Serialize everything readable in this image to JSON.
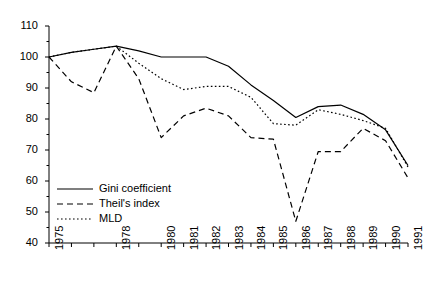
{
  "chart_data": {
    "type": "line",
    "title": "",
    "subtitle": "",
    "xlabel": "",
    "ylabel": "",
    "xlim": [
      1975,
      1991
    ],
    "ylim": [
      40,
      110
    ],
    "grid": false,
    "legend_position": "inside-bottom-left",
    "x": [
      1975,
      1976,
      1977,
      1978,
      1979,
      1980,
      1981,
      1982,
      1983,
      1984,
      1985,
      1986,
      1987,
      1988,
      1989,
      1990,
      1991
    ],
    "y_ticks": [
      40,
      50,
      60,
      70,
      80,
      90,
      100,
      110
    ],
    "y_minor_ticks": [
      45,
      55,
      65,
      75,
      85,
      95,
      105
    ],
    "x_tick_labels": [
      "1975",
      "",
      "",
      "1978",
      "",
      "1980",
      "1981",
      "1982",
      "1983",
      "1984",
      "1985",
      "1986",
      "1987",
      "1988",
      "1989",
      "1990",
      "1991"
    ],
    "series": [
      {
        "name": "Gini coefficient",
        "style": "solid",
        "color": "#000000",
        "values": [
          100,
          101.5,
          102.5,
          103.5,
          102,
          100,
          100,
          100,
          97,
          91,
          86,
          80.5,
          84,
          84.5,
          81.5,
          76.5,
          65
        ]
      },
      {
        "name": "Theil's index",
        "style": "dashed",
        "color": "#000000",
        "values": [
          100,
          92,
          88.5,
          103.5,
          93,
          74,
          81,
          83.5,
          81,
          74,
          73.5,
          47,
          69.5,
          69.5,
          77,
          73,
          61
        ]
      },
      {
        "name": "MLD",
        "style": "dotted",
        "color": "#000000",
        "values": [
          100,
          101.5,
          102.5,
          103.5,
          98,
          93,
          89.5,
          90.5,
          90.5,
          87,
          78.5,
          78,
          83,
          81.5,
          79.5,
          77,
          64.5
        ]
      }
    ]
  },
  "legend": {
    "items": [
      {
        "label": "Gini coefficient",
        "style": "solid"
      },
      {
        "label": "Theil's index",
        "style": "dashed"
      },
      {
        "label": "MLD",
        "style": "dotted"
      }
    ]
  },
  "axis": {
    "y_labels": [
      "110",
      "100",
      "90",
      "80",
      "70",
      "60",
      "50",
      "40"
    ],
    "x_labels": [
      "1975",
      "1978",
      "1980",
      "1981",
      "1982",
      "1983",
      "1984",
      "1985",
      "1986",
      "1987",
      "1988",
      "1989",
      "1990",
      "1991"
    ]
  },
  "colors": {
    "axis": "#000000",
    "line": "#000000",
    "background": "#ffffff"
  }
}
